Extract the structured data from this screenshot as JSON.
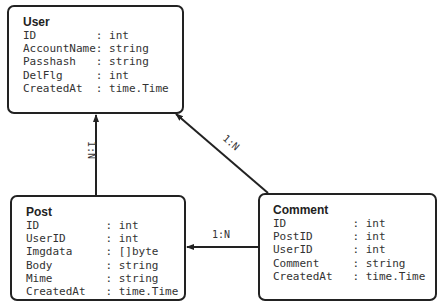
{
  "entities": {
    "user": {
      "title": "User",
      "fields": [
        {
          "name": "ID",
          "type": "int"
        },
        {
          "name": "AccountName",
          "type": "string"
        },
        {
          "name": "Passhash",
          "type": "string"
        },
        {
          "name": "DelFlg",
          "type": "int"
        },
        {
          "name": "CreatedAt",
          "type": "time.Time"
        }
      ]
    },
    "post": {
      "title": "Post",
      "fields": [
        {
          "name": "ID",
          "type": "int"
        },
        {
          "name": "UserID",
          "type": "int"
        },
        {
          "name": "Imgdata",
          "type": "[]byte"
        },
        {
          "name": "Body",
          "type": "string"
        },
        {
          "name": "Mime",
          "type": "string"
        },
        {
          "name": "CreatedAt",
          "type": "time.Time"
        }
      ]
    },
    "comment": {
      "title": "Comment",
      "fields": [
        {
          "name": "ID",
          "type": "int"
        },
        {
          "name": "PostID",
          "type": "int"
        },
        {
          "name": "UserID",
          "type": "int"
        },
        {
          "name": "Comment",
          "type": "string"
        },
        {
          "name": "CreatedAt",
          "type": "time.Time"
        }
      ]
    }
  },
  "relations": {
    "post_user": {
      "label": "1:N"
    },
    "comment_user": {
      "label": "1:N"
    },
    "comment_post": {
      "label": "1:N"
    }
  },
  "separator": ":"
}
